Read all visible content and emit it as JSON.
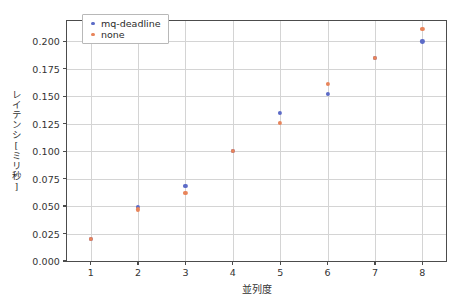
{
  "window": {
    "chrome_accent_color": "#8a98bf"
  },
  "chart_data": {
    "type": "scatter",
    "title": "",
    "xlabel": "並列度",
    "ylabel": "レイテンシ[ミリ秒]",
    "x": [
      1,
      2,
      3,
      4,
      5,
      6,
      7,
      8
    ],
    "xticklabels": [
      "1",
      "2",
      "3",
      "4",
      "5",
      "6",
      "7",
      "8"
    ],
    "yticks": [
      0.0,
      0.025,
      0.05,
      0.075,
      0.1,
      0.125,
      0.15,
      0.175,
      0.2
    ],
    "yticklabels": [
      "0.000",
      "0.025",
      "0.050",
      "0.075",
      "0.100",
      "0.125",
      "0.150",
      "0.175",
      "0.200"
    ],
    "xlim": [
      0.5,
      8.5
    ],
    "ylim": [
      0.0,
      0.2185
    ],
    "grid": true,
    "legend_position": "upper left",
    "series": [
      {
        "name": "mq-deadline",
        "color": "#5c6bc7",
        "values": [
          0.02,
          0.049,
          0.068,
          0.1,
          0.135,
          0.152,
          0.185,
          0.2
        ]
      },
      {
        "name": "none",
        "color": "#e8845a",
        "values": [
          0.02,
          0.047,
          0.062,
          0.1,
          0.126,
          0.161,
          0.185,
          0.211
        ]
      }
    ]
  }
}
